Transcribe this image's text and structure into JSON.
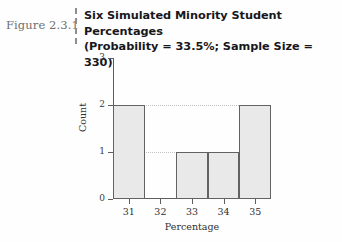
{
  "figure": {
    "label": "Figure 2.3.1",
    "title_line1": "Six Simulated Minority Student Percentages",
    "title_line2": "(Probability = 33.5%; Sample Size = 330)"
  },
  "chart_data": {
    "type": "bar",
    "title": "Six Simulated Minority Student Percentages (Probability = 33.5%; Sample Size = 330)",
    "xlabel": "Percentage",
    "ylabel": "Count",
    "categories": [
      "31",
      "32",
      "33",
      "34",
      "35"
    ],
    "values": [
      2,
      0,
      1,
      1,
      2
    ],
    "xlim": [
      30.5,
      35.5
    ],
    "ylim": [
      0,
      3
    ],
    "ytick_labels": [
      "0",
      "1",
      "2",
      "3"
    ],
    "ytick_values": [
      0,
      1,
      2,
      3
    ],
    "xtick_labels": [
      "31",
      "32",
      "33",
      "34",
      "35"
    ],
    "xtick_values": [
      31,
      32,
      33,
      34,
      35
    ],
    "grid": "horizontal-dotted",
    "gridline_values": [
      1,
      2
    ],
    "legend": null,
    "bar_fill_color": "#e9e9e9",
    "bar_border_color": "#626262",
    "axis_color": "#5e5e5e"
  }
}
